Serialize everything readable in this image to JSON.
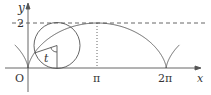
{
  "diagram": {
    "type": "cycloid",
    "labels": {
      "y_axis": "y",
      "x_axis": "x",
      "origin": "O",
      "y_tick": "2",
      "x_tick_pi": "π",
      "x_tick_2pi": "2π",
      "angle": "t"
    },
    "colors": {
      "stroke": "#444444",
      "background": "#ffffff"
    }
  }
}
